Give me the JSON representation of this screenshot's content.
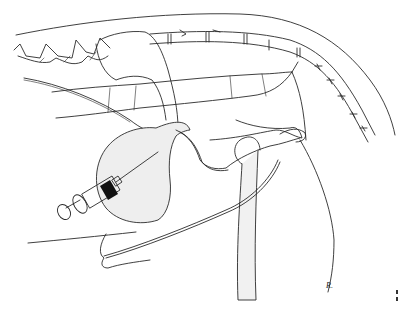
{
  "illustration": {
    "subject": "Lateral anatomical line drawing with syringe needle inserted into bladder",
    "elements": [
      "spine-vertebrae",
      "dorsal-body-outline",
      "kidney",
      "colon",
      "bladder",
      "syringe",
      "needle",
      "ureter",
      "pelvis",
      "hind-leg-femur",
      "ventral-abdominal-wall",
      "penis-prepuce"
    ],
    "colors": {
      "line": "#2a2a2a",
      "fill": "#eeeeee",
      "background": "#ffffff",
      "syringe_band": "#111111"
    }
  },
  "signature": {
    "text": "R."
  }
}
